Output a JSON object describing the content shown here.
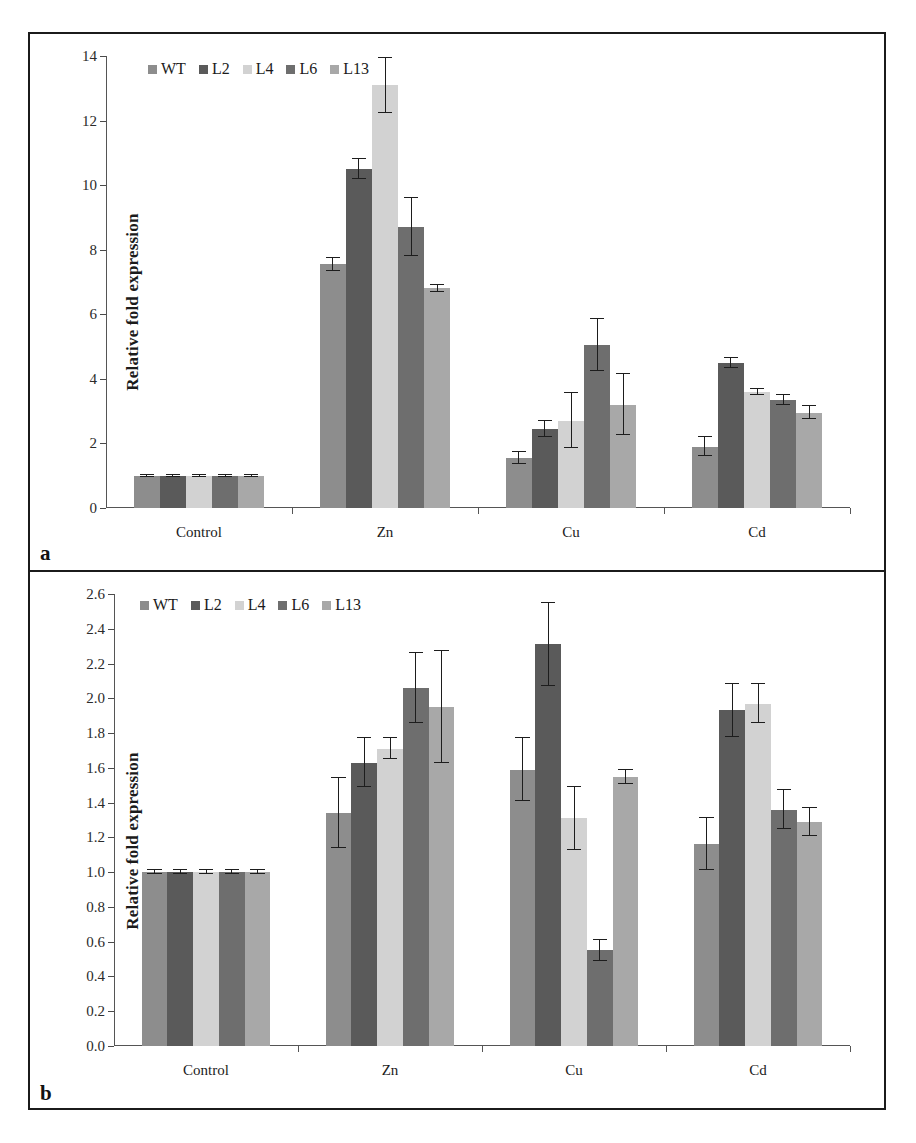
{
  "figure": {
    "panels": [
      {
        "id": "a",
        "label": "a",
        "ylabel": "Relative fold expression",
        "chart_data": {
          "type": "bar",
          "title": "",
          "xlabel": "",
          "ylabel": "Relative fold expression",
          "ylim": [
            0,
            14
          ],
          "ytick_step": 2,
          "yticks": [
            "0",
            "2",
            "4",
            "6",
            "8",
            "10",
            "12",
            "14"
          ],
          "grid": false,
          "legend_position": "top-left",
          "categories": [
            "Control",
            "Zn",
            "Cu",
            "Cd"
          ],
          "series": [
            {
              "name": "WT",
              "color": "#8d8d8d",
              "values": [
                1.0,
                7.55,
                1.55,
                1.9
              ],
              "errors": [
                0.03,
                0.2,
                0.2,
                0.3
              ]
            },
            {
              "name": "L2",
              "color": "#5a5a5a",
              "values": [
                1.0,
                10.5,
                2.45,
                4.5
              ],
              "errors": [
                0.03,
                0.3,
                0.25,
                0.15
              ]
            },
            {
              "name": "L4",
              "color": "#d2d2d2",
              "values": [
                1.0,
                13.1,
                2.7,
                3.6
              ],
              "errors": [
                0.03,
                0.85,
                0.85,
                0.1
              ]
            },
            {
              "name": "L6",
              "color": "#6e6e6e",
              "values": [
                1.0,
                8.7,
                5.05,
                3.35
              ],
              "errors": [
                0.03,
                0.9,
                0.8,
                0.15
              ]
            },
            {
              "name": "L13",
              "color": "#a8a8a8",
              "values": [
                1.0,
                6.8,
                3.2,
                2.95
              ],
              "errors": [
                0.03,
                0.1,
                0.95,
                0.2
              ]
            }
          ]
        }
      },
      {
        "id": "b",
        "label": "b",
        "ylabel": "Relative fold expression",
        "chart_data": {
          "type": "bar",
          "title": "",
          "xlabel": "",
          "ylabel": "Relative fold expression",
          "ylim": [
            0,
            2.6
          ],
          "ytick_step": 0.2,
          "yticks": [
            "0.0",
            "0.2",
            "0.4",
            "0.6",
            "0.8",
            "1.0",
            "1.2",
            "1.4",
            "1.6",
            "1.8",
            "2.0",
            "2.2",
            "2.4",
            "2.6"
          ],
          "grid": false,
          "legend_position": "top-left",
          "categories": [
            "Control",
            "Zn",
            "Cu",
            "Cd"
          ],
          "series": [
            {
              "name": "WT",
              "color": "#8d8d8d",
              "values": [
                1.0,
                1.34,
                1.59,
                1.16
              ],
              "errors": [
                0.01,
                0.2,
                0.18,
                0.15
              ]
            },
            {
              "name": "L2",
              "color": "#5a5a5a",
              "values": [
                1.0,
                1.63,
                2.31,
                1.93
              ],
              "errors": [
                0.01,
                0.14,
                0.24,
                0.15
              ]
            },
            {
              "name": "L4",
              "color": "#d2d2d2",
              "values": [
                1.0,
                1.71,
                1.31,
                1.97
              ],
              "errors": [
                0.01,
                0.06,
                0.18,
                0.11
              ]
            },
            {
              "name": "L6",
              "color": "#6e6e6e",
              "values": [
                1.0,
                2.06,
                0.55,
                1.36
              ],
              "errors": [
                0.01,
                0.2,
                0.06,
                0.11
              ]
            },
            {
              "name": "L13",
              "color": "#a8a8a8",
              "values": [
                1.0,
                1.95,
                1.55,
                1.29
              ],
              "errors": [
                0.01,
                0.32,
                0.04,
                0.08
              ]
            }
          ]
        }
      }
    ]
  }
}
